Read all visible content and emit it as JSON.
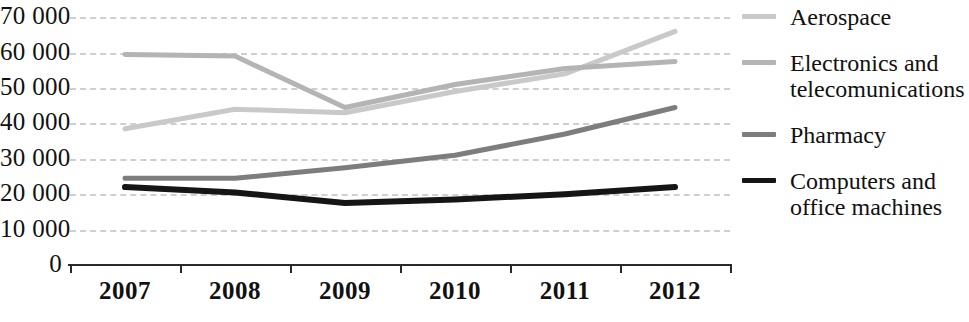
{
  "chart_data": {
    "type": "line",
    "title": "",
    "subtitle": "",
    "xlabel": "",
    "ylabel": "",
    "categories": [
      "2007",
      "2008",
      "2009",
      "2010",
      "2011",
      "2012"
    ],
    "ylim": [
      0,
      70000
    ],
    "y_ticks": [
      0,
      10000,
      20000,
      30000,
      40000,
      50000,
      60000,
      70000
    ],
    "y_tick_labels": [
      "0",
      "10 000",
      "20 000",
      "30 000",
      "40 000",
      "50 000",
      "60 000",
      "70 000"
    ],
    "grid": true,
    "grid_style": "dashed-horizontal",
    "legend_position": "right",
    "series": [
      {
        "name": "Aerospace",
        "color": "#c9c9c9",
        "values": [
          38500,
          44000,
          43000,
          49000,
          54000,
          66000
        ]
      },
      {
        "name": "Electronics and telecomunications",
        "label_lines": "Electronics and\ntelecomunications",
        "color": "#b4b4b4",
        "values": [
          59500,
          59000,
          44500,
          51000,
          55500,
          57500
        ]
      },
      {
        "name": "Pharmacy",
        "label_lines": "Pharmacy",
        "color": "#7d7d7d",
        "values": [
          24500,
          24500,
          27500,
          31000,
          37000,
          44500
        ]
      },
      {
        "name": "Computers and office machines",
        "label_lines": "Computers and\noffice machines",
        "color": "#151515",
        "values": [
          22000,
          20500,
          17500,
          18500,
          20000,
          22000
        ]
      }
    ]
  },
  "axis": {
    "axis_line_color": "#2a2a2a",
    "gridline_color": "#cfcfcf"
  }
}
